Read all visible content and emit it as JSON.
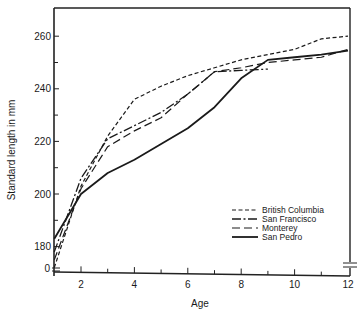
{
  "chart_data": {
    "type": "line",
    "title": "",
    "xlabel": "Age",
    "ylabel": "Standard length in mm",
    "xlim": [
      1,
      12
    ],
    "ylim": [
      170,
      267
    ],
    "y_axis_break": true,
    "x_ticks": [
      2,
      4,
      6,
      8,
      10,
      12
    ],
    "y_ticks": [
      0,
      180,
      200,
      220,
      240,
      260
    ],
    "grid": false,
    "legend_position": "lower right",
    "series": [
      {
        "name": "British Columbia",
        "style": "short-dash",
        "x": [
          1,
          2,
          3,
          4,
          5,
          6,
          7,
          8,
          9,
          10,
          11,
          12
        ],
        "y": [
          172,
          203,
          222,
          236,
          241,
          245,
          248,
          251,
          253,
          255,
          259,
          260
        ]
      },
      {
        "name": "San Francisco",
        "style": "dash-dot",
        "x": [
          1,
          2,
          3,
          4,
          5,
          6,
          7,
          8,
          9
        ],
        "y": [
          178,
          206,
          221,
          226,
          231,
          238,
          246.5,
          247,
          247.5
        ]
      },
      {
        "name": "Monterey",
        "style": "long-dash",
        "x": [
          1,
          2,
          3,
          4,
          5,
          6,
          7,
          8,
          9,
          10,
          11,
          12
        ],
        "y": [
          175,
          202,
          218,
          224,
          229,
          238,
          246.5,
          248,
          250,
          251,
          252,
          255
        ]
      },
      {
        "name": "San Pedro",
        "style": "solid",
        "x": [
          1,
          2,
          3,
          4,
          5,
          6,
          7,
          8,
          9,
          10,
          11,
          12
        ],
        "y": [
          183,
          200,
          208,
          213,
          219,
          225,
          233,
          244,
          251,
          252,
          253,
          254.5
        ]
      }
    ]
  },
  "labels": {
    "x_axis_title": "Age",
    "y_axis_title": "Standard length in mm",
    "y_break_label": "0"
  }
}
